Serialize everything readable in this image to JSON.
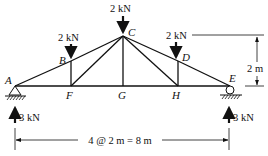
{
  "diagram": {
    "type": "truss",
    "nodes": [
      {
        "id": "A",
        "label": "A",
        "x": 15,
        "y": 86
      },
      {
        "id": "B",
        "label": "B",
        "x": 71,
        "y": 61
      },
      {
        "id": "C",
        "label": "C",
        "x": 123,
        "y": 36
      },
      {
        "id": "D",
        "label": "D",
        "x": 178,
        "y": 61
      },
      {
        "id": "E",
        "label": "E",
        "x": 230,
        "y": 86
      },
      {
        "id": "F",
        "label": "F",
        "x": 71,
        "y": 86
      },
      {
        "id": "G",
        "label": "G",
        "x": 123,
        "y": 86
      },
      {
        "id": "H",
        "label": "H",
        "x": 178,
        "y": 86
      }
    ],
    "members": [
      [
        "A",
        "B"
      ],
      [
        "B",
        "C"
      ],
      [
        "C",
        "D"
      ],
      [
        "D",
        "E"
      ],
      [
        "A",
        "F"
      ],
      [
        "F",
        "G"
      ],
      [
        "G",
        "H"
      ],
      [
        "H",
        "E"
      ],
      [
        "B",
        "F"
      ],
      [
        "F",
        "C"
      ],
      [
        "C",
        "G"
      ],
      [
        "C",
        "H"
      ],
      [
        "H",
        "D"
      ]
    ],
    "loads": [
      {
        "node": "B",
        "label": "2 kN",
        "direction": "down"
      },
      {
        "node": "C",
        "label": "2 kN",
        "direction": "down"
      },
      {
        "node": "D",
        "label": "2 kN",
        "direction": "down"
      }
    ],
    "reactions": [
      {
        "node": "A",
        "label": "3 kN",
        "direction": "up",
        "support": "pin"
      },
      {
        "node": "E",
        "label": "3 kN",
        "direction": "up",
        "support": "roller"
      }
    ],
    "dimensions": {
      "span": "4 @ 2 m = 8 m",
      "height": "2 m"
    }
  }
}
